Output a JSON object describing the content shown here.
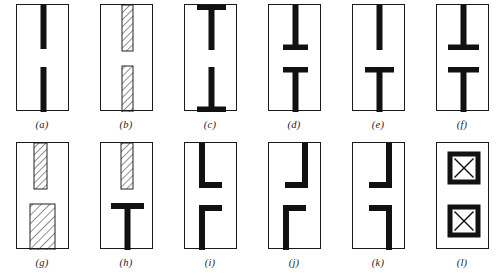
{
  "figure": {
    "type": "technical-line-drawing-grid",
    "columns": 6,
    "rows": 2,
    "panel_width_px": 53,
    "panel_height_px": 107,
    "colors": {
      "solid_fill": "#111111",
      "outline": "#1a1a1a",
      "hatch_line": "#333333",
      "background": "#ffffff",
      "caption": "#1d1d1d"
    },
    "panels": [
      {
        "id": "a",
        "caption": "(a)",
        "layout": "two plain vertical bars, centered, separated by a central gap",
        "shapes": [
          {
            "kind": "vertical-bar",
            "fill": "solid",
            "x": 23.5,
            "y": 0,
            "w": 6,
            "h": 44
          },
          {
            "kind": "vertical-bar",
            "fill": "solid",
            "x": 23.5,
            "y": 62,
            "w": 6,
            "h": 45
          }
        ]
      },
      {
        "id": "b",
        "caption": "(b)",
        "layout": "two hatched vertical bars, centered, separated by a central gap",
        "shapes": [
          {
            "kind": "vertical-bar",
            "fill": "hatch",
            "x": 21,
            "y": 0,
            "w": 11,
            "h": 46
          },
          {
            "kind": "vertical-bar",
            "fill": "hatch",
            "x": 21,
            "y": 61,
            "w": 11,
            "h": 46
          }
        ]
      },
      {
        "id": "c",
        "caption": "(c)",
        "layout": "two I-beams: vertical webs with flanges at the outer top and bottom edges",
        "shapes": [
          {
            "kind": "horizontal-flange",
            "fill": "solid",
            "x": 12,
            "y": 0,
            "w": 29,
            "h": 5
          },
          {
            "kind": "vertical-bar",
            "fill": "solid",
            "x": 23.5,
            "y": 0,
            "w": 6,
            "h": 45
          },
          {
            "kind": "vertical-bar",
            "fill": "solid",
            "x": 23.5,
            "y": 62,
            "w": 6,
            "h": 45
          },
          {
            "kind": "horizontal-flange",
            "fill": "solid",
            "x": 12,
            "y": 102,
            "w": 29,
            "h": 5
          }
        ]
      },
      {
        "id": "d",
        "caption": "(d)",
        "layout": "two T-shapes facing each other: flanges on the inner ends of both bars",
        "shapes": [
          {
            "kind": "vertical-bar",
            "fill": "solid",
            "x": 23.5,
            "y": 0,
            "w": 6,
            "h": 45
          },
          {
            "kind": "horizontal-flange",
            "fill": "solid",
            "x": 14,
            "y": 40,
            "w": 25,
            "h": 5
          },
          {
            "kind": "horizontal-flange",
            "fill": "solid",
            "x": 14,
            "y": 62,
            "w": 25,
            "h": 5
          },
          {
            "kind": "vertical-bar",
            "fill": "solid",
            "x": 23.5,
            "y": 62,
            "w": 6,
            "h": 45
          }
        ]
      },
      {
        "id": "e",
        "caption": "(e)",
        "layout": "plain vertical bar on top; lower bar is a T with a flange at its upper end",
        "shapes": [
          {
            "kind": "vertical-bar",
            "fill": "solid",
            "x": 23.5,
            "y": 0,
            "w": 6,
            "h": 45
          },
          {
            "kind": "horizontal-flange",
            "fill": "solid",
            "x": 12,
            "y": 62,
            "w": 29,
            "h": 5.5
          },
          {
            "kind": "vertical-bar",
            "fill": "solid",
            "x": 23.5,
            "y": 62,
            "w": 6,
            "h": 45
          }
        ]
      },
      {
        "id": "f",
        "caption": "(f)",
        "layout": "two T-shapes facing each other with wide flanges on the inner ends",
        "shapes": [
          {
            "kind": "vertical-bar",
            "fill": "solid",
            "x": 23.5,
            "y": 0,
            "w": 6,
            "h": 45
          },
          {
            "kind": "horizontal-flange",
            "fill": "solid",
            "x": 11,
            "y": 40,
            "w": 31,
            "h": 5.5
          },
          {
            "kind": "horizontal-flange",
            "fill": "solid",
            "x": 11,
            "y": 62,
            "w": 31,
            "h": 5.5
          },
          {
            "kind": "vertical-bar",
            "fill": "solid",
            "x": 23.5,
            "y": 62,
            "w": 6,
            "h": 45
          }
        ]
      },
      {
        "id": "g",
        "caption": "(g)",
        "layout": "narrow hatched bar on top, wide hatched block below",
        "shapes": [
          {
            "kind": "vertical-bar",
            "fill": "hatch",
            "x": 17,
            "y": 0,
            "w": 13,
            "h": 46
          },
          {
            "kind": "block",
            "fill": "hatch",
            "x": 13,
            "y": 61,
            "w": 25,
            "h": 46
          }
        ]
      },
      {
        "id": "h",
        "caption": "(h)",
        "layout": "hatched vertical bar on top, solid black T-shape below",
        "shapes": [
          {
            "kind": "vertical-bar",
            "fill": "hatch",
            "x": 20,
            "y": 0,
            "w": 12,
            "h": 46
          },
          {
            "kind": "horizontal-flange",
            "fill": "solid",
            "x": 10,
            "y": 60,
            "w": 33,
            "h": 6
          },
          {
            "kind": "vertical-bar",
            "fill": "solid",
            "x": 23.5,
            "y": 60,
            "w": 6,
            "h": 47
          }
        ]
      },
      {
        "id": "i",
        "caption": "(i)",
        "layout": "two L-shapes, both webs left of center with flanges pointing right",
        "shapes": [
          {
            "kind": "vertical-bar",
            "fill": "solid",
            "x": 14,
            "y": 0,
            "w": 6,
            "h": 45
          },
          {
            "kind": "horizontal-flange",
            "fill": "solid",
            "x": 14,
            "y": 39,
            "w": 23,
            "h": 6
          },
          {
            "kind": "horizontal-flange",
            "fill": "solid",
            "x": 14,
            "y": 62,
            "w": 23,
            "h": 6
          },
          {
            "kind": "vertical-bar",
            "fill": "solid",
            "x": 14,
            "y": 62,
            "w": 6,
            "h": 45
          }
        ]
      },
      {
        "id": "j",
        "caption": "(j)",
        "layout": "mirrored L-shapes: upper web right with leftward flange, lower web left with rightward flange",
        "shapes": [
          {
            "kind": "vertical-bar",
            "fill": "solid",
            "x": 33,
            "y": 0,
            "w": 6,
            "h": 45
          },
          {
            "kind": "horizontal-flange",
            "fill": "solid",
            "x": 16,
            "y": 39,
            "w": 23,
            "h": 6
          },
          {
            "kind": "horizontal-flange",
            "fill": "solid",
            "x": 14,
            "y": 62,
            "w": 23,
            "h": 6
          },
          {
            "kind": "vertical-bar",
            "fill": "solid",
            "x": 14,
            "y": 62,
            "w": 6,
            "h": 45
          }
        ]
      },
      {
        "id": "k",
        "caption": "(k)",
        "layout": "two L-shapes, both webs right of center with flanges pointing left",
        "shapes": [
          {
            "kind": "vertical-bar",
            "fill": "solid",
            "x": 33,
            "y": 0,
            "w": 6,
            "h": 45
          },
          {
            "kind": "horizontal-flange",
            "fill": "solid",
            "x": 16,
            "y": 39,
            "w": 23,
            "h": 6
          },
          {
            "kind": "horizontal-flange",
            "fill": "solid",
            "x": 16,
            "y": 62,
            "w": 23,
            "h": 6
          },
          {
            "kind": "vertical-bar",
            "fill": "solid",
            "x": 33,
            "y": 62,
            "w": 6,
            "h": 45
          }
        ]
      },
      {
        "id": "l",
        "caption": "(l)",
        "layout": "two square boxes with thick black borders, each containing an X diagonal cross",
        "shapes": [
          {
            "kind": "crossed-box",
            "fill": "solid-border",
            "x": 13,
            "y": 11,
            "w": 28,
            "h": 28,
            "border": 5
          },
          {
            "kind": "crossed-box",
            "fill": "solid-border",
            "x": 13,
            "y": 64,
            "w": 28,
            "h": 28,
            "border": 5
          }
        ]
      }
    ]
  }
}
